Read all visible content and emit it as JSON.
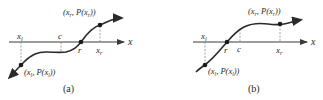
{
  "figure": {
    "panels": [
      {
        "caption": "(a)",
        "axis_label": "x",
        "ticks": {
          "xl": "x",
          "xl_sub": "l",
          "c": "c",
          "r": "r",
          "xr": "x",
          "xr_sub": "r"
        },
        "point_low": {
          "open": "(x",
          "sub1": "l",
          "mid": ", P(x",
          "sub2": "l",
          "close": "))"
        },
        "point_high": {
          "open": "(x",
          "sub1": "r",
          "mid": ", P(x",
          "sub2": "r",
          "close": "))"
        }
      },
      {
        "caption": "(b)",
        "axis_label": "x",
        "ticks": {
          "xl": "x",
          "xl_sub": "l",
          "c": "c",
          "r": "r",
          "xr": "x",
          "xr_sub": "r"
        },
        "point_low": {
          "open": "(x",
          "sub1": "l",
          "mid": ", P(x",
          "sub2": "l",
          "close": "))"
        },
        "point_high": {
          "open": "(x",
          "sub1": "r",
          "mid": ", P(x",
          "sub2": "r",
          "close": "))"
        }
      }
    ],
    "colors": {
      "curve": "#2a2a2a",
      "axis": "#3a3a3a",
      "guide": "#7a7a7a"
    }
  }
}
